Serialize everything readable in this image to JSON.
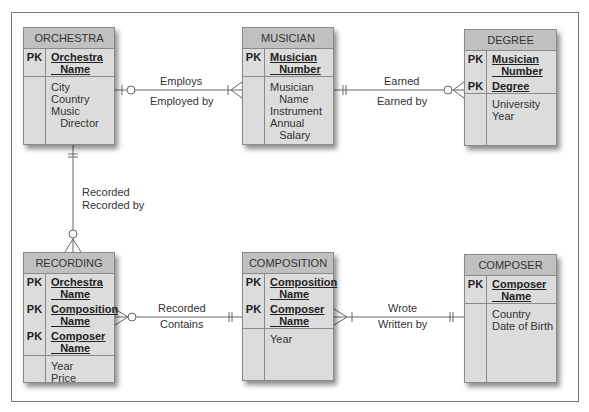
{
  "entities": {
    "orchestra": {
      "title": "ORCHESTRA",
      "pk": [
        {
          "label": "PK",
          "name": "Orchestra\n   Name"
        }
      ],
      "attributes": "City\nCountry\nMusic\n   Director"
    },
    "musician": {
      "title": "MUSICIAN",
      "pk": [
        {
          "label": "PK",
          "name": "Musician\n   Number"
        }
      ],
      "attributes": "Musician\n   Name\nInstrument\nAnnual\n   Salary"
    },
    "degree": {
      "title": "DEGREE",
      "pk": [
        {
          "label": "PK",
          "name": "Musician\n   Number"
        },
        {
          "label": "PK",
          "name": "Degree"
        }
      ],
      "attributes": "University\nYear"
    },
    "recording": {
      "title": "RECORDING",
      "pk": [
        {
          "label": "PK",
          "name": "Orchestra\n   Name"
        },
        {
          "label": "PK",
          "name": "Composition\n   Name"
        },
        {
          "label": "PK",
          "name": "Composer\n   Name"
        }
      ],
      "attributes": "Year\nPrice"
    },
    "composition": {
      "title": "COMPOSITION",
      "pk": [
        {
          "label": "PK",
          "name": "Composition\n   Name"
        },
        {
          "label": "PK",
          "name": "Composer\n   Name"
        }
      ],
      "attributes": "Year"
    },
    "composer": {
      "title": "COMPOSER",
      "pk": [
        {
          "label": "PK",
          "name": "Composer\n   Name"
        }
      ],
      "attributes": "Country\nDate of Birth"
    }
  },
  "relationships": {
    "orchestra_musician": {
      "forward": "Employs",
      "reverse": "Employed by"
    },
    "musician_degree": {
      "forward": "Earned",
      "reverse": "Earned by"
    },
    "orchestra_recording": {
      "forward": "Recorded",
      "reverse": "Recorded by"
    },
    "recording_composition": {
      "forward": "Recorded",
      "reverse": "Contains"
    },
    "composition_composer": {
      "forward": "Wrote",
      "reverse": "Written by"
    }
  },
  "colors": {
    "header": "#c0c0c0",
    "body": "#dcdcdc",
    "border": "#8a8a8a",
    "line": "#666666"
  }
}
